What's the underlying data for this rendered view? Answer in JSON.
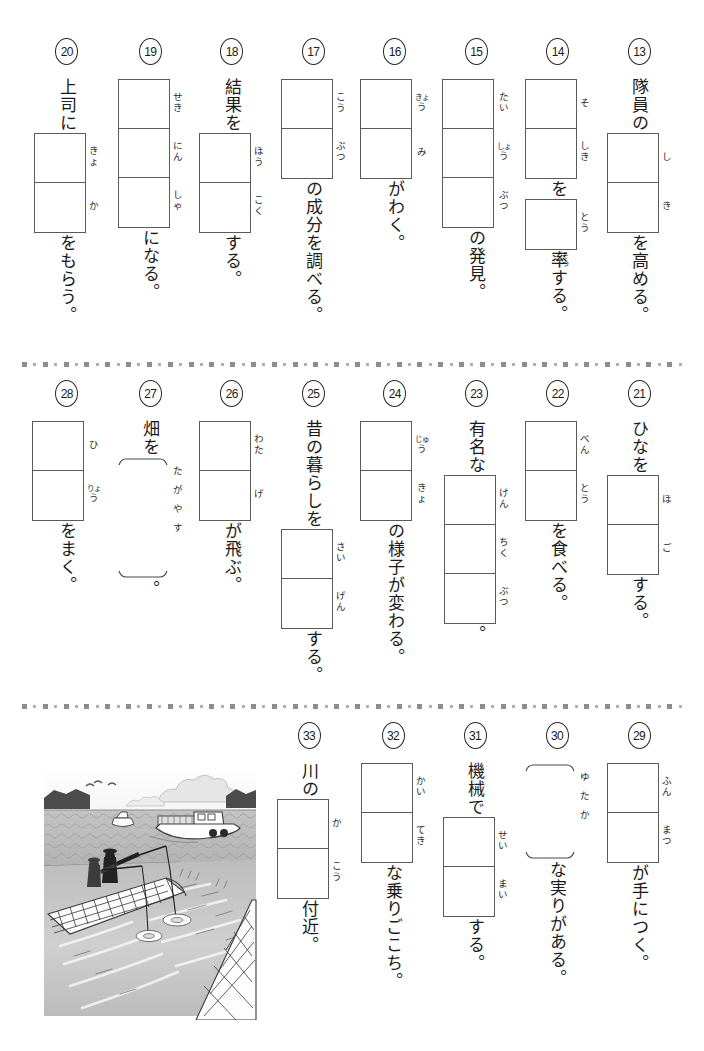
{
  "page": {
    "width": 704,
    "height": 1051,
    "background": "#ffffff",
    "box_border_color": "#5a5a5a",
    "divider_color": "#8d8d8d",
    "text_color": "#1b1b1b"
  },
  "dividers": [
    {
      "name": "divider-row1-row2",
      "y": 361
    },
    {
      "name": "divider-row2-row3",
      "y": 703
    }
  ],
  "rows": [
    {
      "name": "row-1",
      "top": 38,
      "items": [
        {
          "number": "13",
          "pre": "隊員の",
          "boxes": [
            2
          ],
          "furigana": [
            [
              "し"
            ],
            [
              "き"
            ]
          ],
          "post": "を高める。",
          "brace": false
        },
        {
          "number": "14",
          "pre": "",
          "boxes": [
            2,
            1
          ],
          "furigana": [
            [
              "そ"
            ],
            [
              "し",
              "き"
            ]
          ],
          "furigana2": [
            [
              "と",
              "う"
            ]
          ],
          "mid": "を",
          "post": "率する。",
          "post_ruby": "そつ",
          "brace": false
        },
        {
          "number": "15",
          "pre": "",
          "boxes": [
            3
          ],
          "furigana": [
            [
              "た",
              "い"
            ],
            [
              "しょ",
              "う"
            ],
            [
              "ぶ",
              "つ"
            ]
          ],
          "post": "の発見。",
          "brace": false
        },
        {
          "number": "16",
          "pre": "",
          "boxes": [
            2
          ],
          "furigana": [
            [
              "きょ",
              "う"
            ],
            [
              "み"
            ]
          ],
          "post": "がわく。",
          "brace": false
        },
        {
          "number": "17",
          "pre": "",
          "boxes": [
            2
          ],
          "furigana": [
            [
              "こ",
              "う"
            ],
            [
              "ぶ",
              "つ"
            ]
          ],
          "post": "の成分を調べる。",
          "brace": false
        },
        {
          "number": "18",
          "pre": "結果を",
          "boxes": [
            2
          ],
          "furigana": [
            [
              "ほ",
              "う"
            ],
            [
              "こ",
              "く"
            ]
          ],
          "post": "する。",
          "brace": false
        },
        {
          "number": "19",
          "pre": "",
          "boxes": [
            3
          ],
          "furigana": [
            [
              "せ",
              "き"
            ],
            [
              "に",
              "ん"
            ],
            [
              "し",
              "ゃ"
            ]
          ],
          "post": "になる。",
          "brace": false
        },
        {
          "number": "20",
          "pre": "上司に",
          "boxes": [
            2
          ],
          "furigana": [
            [
              "き",
              "ょ"
            ],
            [
              "か"
            ]
          ],
          "post": "をもらう。",
          "brace": false
        }
      ]
    },
    {
      "name": "row-2",
      "top": 380,
      "items": [
        {
          "number": "21",
          "pre": "ひなを",
          "boxes": [
            2
          ],
          "furigana": [
            [
              "ほ"
            ],
            [
              "ご"
            ]
          ],
          "post": "する。",
          "brace": false
        },
        {
          "number": "22",
          "pre": "",
          "boxes": [
            2
          ],
          "furigana": [
            [
              "べ",
              "ん"
            ],
            [
              "と",
              "う"
            ]
          ],
          "post": "を食べる。",
          "brace": false
        },
        {
          "number": "23",
          "pre": "有名な",
          "boxes": [
            3
          ],
          "furigana": [
            [
              "け",
              "ん"
            ],
            [
              "ち",
              "く"
            ],
            [
              "ぶ",
              "つ"
            ]
          ],
          "post": "。",
          "brace": false
        },
        {
          "number": "24",
          "pre": "",
          "boxes": [
            2
          ],
          "furigana": [
            [
              "じゅ",
              "う"
            ],
            [
              "き",
              "ょ"
            ]
          ],
          "post": "の様子が変わる。",
          "brace": false
        },
        {
          "number": "25",
          "pre": "昔の暮らしを",
          "boxes": [
            2
          ],
          "furigana": [
            [
              "さ",
              "い"
            ],
            [
              "げ",
              "ん"
            ]
          ],
          "post": "する。",
          "brace": false
        },
        {
          "number": "26",
          "pre": "",
          "boxes": [
            2
          ],
          "furigana": [
            [
              "わ",
              "た"
            ],
            [
              "げ"
            ]
          ],
          "post": "が飛ぶ。",
          "brace": false
        },
        {
          "number": "27",
          "pre": "畑を",
          "boxes": [],
          "brace": true,
          "brace_furigana": [
            "た",
            "が",
            "や",
            "す"
          ],
          "post": "。"
        },
        {
          "number": "28",
          "pre": "",
          "boxes": [
            2
          ],
          "furigana": [
            [
              "ひ"
            ],
            [
              "りょ",
              "う"
            ]
          ],
          "post": "をまく。",
          "brace": false
        }
      ]
    },
    {
      "name": "row-3",
      "top": 722,
      "items": [
        {
          "number": "29",
          "pre": "",
          "boxes": [
            2
          ],
          "furigana": [
            [
              "ふ",
              "ん"
            ],
            [
              "ま",
              "つ"
            ]
          ],
          "post": "が手につく。",
          "brace": false
        },
        {
          "number": "30",
          "pre": "",
          "boxes": [],
          "brace": true,
          "brace_furigana": [
            "ゆ",
            "た",
            "か"
          ],
          "post": "な実りがある。"
        },
        {
          "number": "31",
          "pre": "機械で",
          "boxes": [
            2
          ],
          "furigana": [
            [
              "せ",
              "い"
            ],
            [
              "ま",
              "い"
            ]
          ],
          "post": "する。",
          "brace": false
        },
        {
          "number": "32",
          "pre": "",
          "boxes": [
            2
          ],
          "furigana": [
            [
              "か",
              "い"
            ],
            [
              "て",
              "き"
            ]
          ],
          "post": "な乗りごこち。",
          "brace": false
        },
        {
          "number": "33",
          "pre": "川の",
          "boxes": [
            2
          ],
          "furigana": [
            [
              "か"
            ],
            [
              "こ",
              "う"
            ]
          ],
          "post": "付近。",
          "brace": false
        }
      ]
    }
  ],
  "illustration": {
    "name": "fishing-pier-scene",
    "description": "two anglers fishing from a pier with boats on the water",
    "x": 30,
    "y": 750,
    "width": 240,
    "height": 270
  }
}
